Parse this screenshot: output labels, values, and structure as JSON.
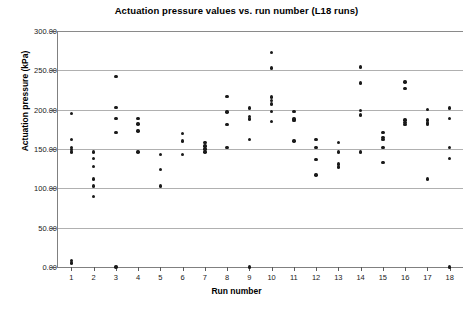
{
  "chart_data": {
    "type": "scatter",
    "title": "Actuation pressure values vs. run number (L18 runs)",
    "xlabel": "Run number",
    "ylabel": "Actuation pressure (kPa)",
    "xlim": [
      0.4,
      18.6
    ],
    "ylim": [
      0,
      300
    ],
    "grid": true,
    "legend": "none",
    "marker_color": "#1a1a1a",
    "x_tick_labels": [
      "1",
      "2",
      "3",
      "4",
      "5",
      "6",
      "7",
      "8",
      "9",
      "10",
      "11",
      "12",
      "13",
      "14",
      "15",
      "16",
      "17",
      "18"
    ],
    "y_tick_labels": [
      "0.00",
      "50.00",
      "100.00",
      "150.00",
      "200.00",
      "250.00",
      "300.00"
    ],
    "y_tick_values": [
      0,
      50,
      100,
      150,
      200,
      250,
      300
    ],
    "x_tick_values": [
      1,
      2,
      3,
      4,
      5,
      6,
      7,
      8,
      9,
      10,
      11,
      12,
      13,
      14,
      15,
      16,
      17,
      18
    ],
    "series": [
      {
        "name": "Actuation pressure",
        "points": [
          {
            "x": 1,
            "y": 195
          },
          {
            "x": 1,
            "y": 162
          },
          {
            "x": 1,
            "y": 152
          },
          {
            "x": 1,
            "y": 149
          },
          {
            "x": 1,
            "y": 146
          },
          {
            "x": 1,
            "y": 8
          },
          {
            "x": 1,
            "y": 5
          },
          {
            "x": 2,
            "y": 146
          },
          {
            "x": 2,
            "y": 138
          },
          {
            "x": 2,
            "y": 128
          },
          {
            "x": 2,
            "y": 112
          },
          {
            "x": 2,
            "y": 103
          },
          {
            "x": 2,
            "y": 90
          },
          {
            "x": 3,
            "y": 242
          },
          {
            "x": 3,
            "y": 203
          },
          {
            "x": 3,
            "y": 189
          },
          {
            "x": 3,
            "y": 171
          },
          {
            "x": 3,
            "y": 0
          },
          {
            "x": 4,
            "y": 189
          },
          {
            "x": 4,
            "y": 182
          },
          {
            "x": 4,
            "y": 173
          },
          {
            "x": 4,
            "y": 146
          },
          {
            "x": 5,
            "y": 143
          },
          {
            "x": 5,
            "y": 124
          },
          {
            "x": 5,
            "y": 103
          },
          {
            "x": 6,
            "y": 170
          },
          {
            "x": 6,
            "y": 160
          },
          {
            "x": 6,
            "y": 143
          },
          {
            "x": 7,
            "y": 158
          },
          {
            "x": 7,
            "y": 154
          },
          {
            "x": 7,
            "y": 150
          },
          {
            "x": 7,
            "y": 146
          },
          {
            "x": 8,
            "y": 217
          },
          {
            "x": 8,
            "y": 197
          },
          {
            "x": 8,
            "y": 181
          },
          {
            "x": 8,
            "y": 152
          },
          {
            "x": 9,
            "y": 202
          },
          {
            "x": 9,
            "y": 191
          },
          {
            "x": 9,
            "y": 188
          },
          {
            "x": 9,
            "y": 162
          },
          {
            "x": 9,
            "y": 0
          },
          {
            "x": 10,
            "y": 273
          },
          {
            "x": 10,
            "y": 253
          },
          {
            "x": 10,
            "y": 216
          },
          {
            "x": 10,
            "y": 212
          },
          {
            "x": 10,
            "y": 207
          },
          {
            "x": 10,
            "y": 198
          },
          {
            "x": 10,
            "y": 185
          },
          {
            "x": 11,
            "y": 198
          },
          {
            "x": 11,
            "y": 188
          },
          {
            "x": 11,
            "y": 186
          },
          {
            "x": 11,
            "y": 160
          },
          {
            "x": 12,
            "y": 162
          },
          {
            "x": 12,
            "y": 152
          },
          {
            "x": 12,
            "y": 137
          },
          {
            "x": 12,
            "y": 117
          },
          {
            "x": 13,
            "y": 158
          },
          {
            "x": 13,
            "y": 146
          },
          {
            "x": 13,
            "y": 131
          },
          {
            "x": 13,
            "y": 127
          },
          {
            "x": 14,
            "y": 254
          },
          {
            "x": 14,
            "y": 234
          },
          {
            "x": 14,
            "y": 199
          },
          {
            "x": 14,
            "y": 193
          },
          {
            "x": 14,
            "y": 146
          },
          {
            "x": 15,
            "y": 171
          },
          {
            "x": 15,
            "y": 165
          },
          {
            "x": 15,
            "y": 162
          },
          {
            "x": 15,
            "y": 152
          },
          {
            "x": 15,
            "y": 133
          },
          {
            "x": 16,
            "y": 235
          },
          {
            "x": 16,
            "y": 227
          },
          {
            "x": 16,
            "y": 187
          },
          {
            "x": 16,
            "y": 184
          },
          {
            "x": 16,
            "y": 181
          },
          {
            "x": 17,
            "y": 200
          },
          {
            "x": 17,
            "y": 187
          },
          {
            "x": 17,
            "y": 183
          },
          {
            "x": 17,
            "y": 181
          },
          {
            "x": 17,
            "y": 112
          },
          {
            "x": 18,
            "y": 202
          },
          {
            "x": 18,
            "y": 189
          },
          {
            "x": 18,
            "y": 152
          },
          {
            "x": 18,
            "y": 138
          },
          {
            "x": 18,
            "y": 0
          }
        ]
      }
    ]
  }
}
